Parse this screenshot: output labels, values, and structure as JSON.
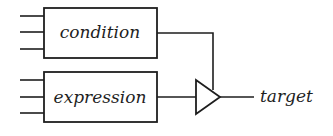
{
  "diagram": {
    "type": "block-diagram",
    "blocks": [
      {
        "id": "condition",
        "label": "condition",
        "inputs": 3
      },
      {
        "id": "expression",
        "label": "expression",
        "inputs": 3
      }
    ],
    "gate": {
      "type": "buffer-triangle",
      "control": "condition",
      "data": "expression"
    },
    "output": {
      "label": "target"
    },
    "colors": {
      "stroke": "#1e1e1e",
      "background": "#ffffff"
    }
  }
}
